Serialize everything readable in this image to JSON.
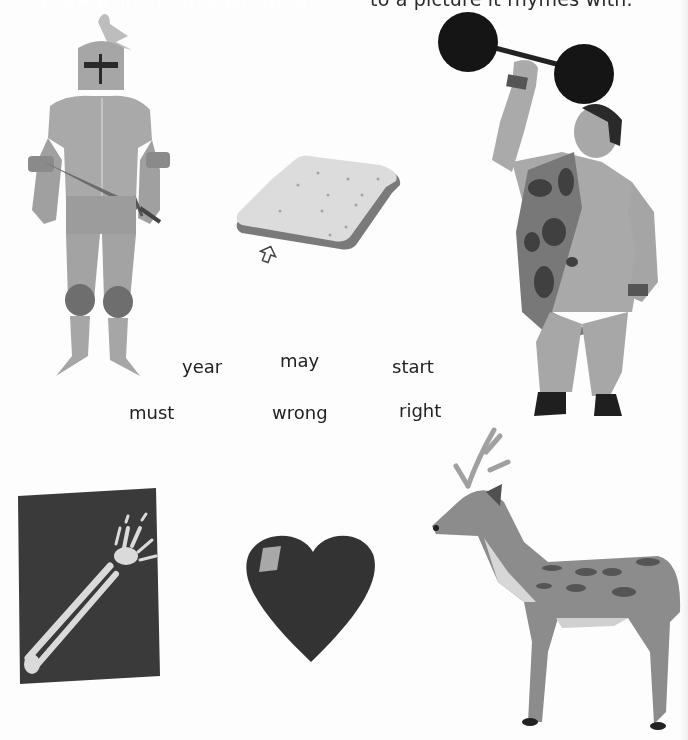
{
  "header": {
    "left_text": "Draw a line from each word",
    "right_text": "to a picture it rhymes with."
  },
  "words": [
    {
      "id": "year",
      "text": "year"
    },
    {
      "id": "may",
      "text": "may"
    },
    {
      "id": "start",
      "text": "start"
    },
    {
      "id": "must",
      "text": "must"
    },
    {
      "id": "wrong",
      "text": "wrong"
    },
    {
      "id": "right",
      "text": "right"
    }
  ],
  "pictures": [
    {
      "id": "knight",
      "label": "knight"
    },
    {
      "id": "bread",
      "label": "bread"
    },
    {
      "id": "strongman",
      "label": "strong man"
    },
    {
      "id": "xray",
      "label": "x-ray of arm"
    },
    {
      "id": "heart",
      "label": "heart"
    },
    {
      "id": "deer",
      "label": "deer"
    }
  ],
  "cursor": {
    "icon": "mouse-pointer-icon"
  }
}
